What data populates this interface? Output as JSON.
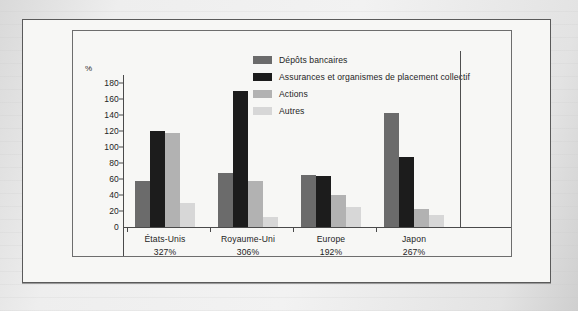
{
  "chart_data": {
    "type": "bar",
    "title": "",
    "subtitle": "",
    "xlabel": "",
    "ylabel": "%",
    "ylim": [
      0,
      190
    ],
    "yticks": [
      0,
      20,
      40,
      60,
      80,
      100,
      120,
      140,
      160,
      180
    ],
    "grid": false,
    "legend_position": "top-center",
    "categories": [
      "États-Unis",
      "Royaume-Uni",
      "Europe",
      "Japon"
    ],
    "category_totals": [
      "327%",
      "306%",
      "192%",
      "267%"
    ],
    "series": [
      {
        "name": "Dépôts bancaires",
        "color": "#6b6b6b",
        "values": [
          58,
          67,
          65,
          143
        ]
      },
      {
        "name": "Assurances et organismes de placement collectif",
        "color": "#1c1c1c",
        "values": [
          120,
          170,
          64,
          88
        ]
      },
      {
        "name": "Actions",
        "color": "#b2b2b2",
        "values": [
          118,
          58,
          40,
          23
        ]
      },
      {
        "name": "Autres",
        "color": "#d7d7d7",
        "values": [
          30,
          12,
          25,
          15
        ]
      }
    ]
  },
  "axis": {
    "unit_label": "%",
    "tick_labels": [
      "180",
      "160",
      "140",
      "120",
      "100",
      "80",
      "60",
      "40",
      "20",
      "0"
    ]
  },
  "legend": {
    "items": [
      {
        "label": "Dépôts bancaires",
        "color": "#6b6b6b"
      },
      {
        "label": "Assurances et organismes de placement collectif",
        "color": "#1c1c1c"
      },
      {
        "label": "Actions",
        "color": "#b2b2b2"
      },
      {
        "label": "Autres",
        "color": "#d7d7d7"
      }
    ]
  },
  "colors": {
    "frame": "#5a5a5a",
    "plot_border": "#6d6d6d",
    "axis": "#4a4a4a",
    "text": "#1d1d1d",
    "paper": "#f7f7f5"
  }
}
